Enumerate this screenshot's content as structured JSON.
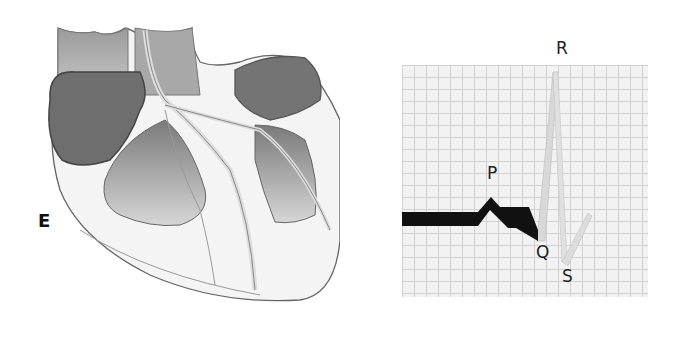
{
  "figure": {
    "panel_label": "E",
    "heart_diagram": {
      "description": "cross-section illustration of the heart showing conduction pathways"
    },
    "ecg_strip": {
      "wave_labels": {
        "p": "P",
        "q": "Q",
        "r": "R",
        "s": "S"
      }
    }
  },
  "colors": {
    "trace_highlighted": "#111111",
    "trace_faded": "#d0d0d0",
    "grid_line": "#d2d2d2",
    "grid_bg": "#f2f2f2",
    "heart_shade": "#8a8a8a"
  }
}
